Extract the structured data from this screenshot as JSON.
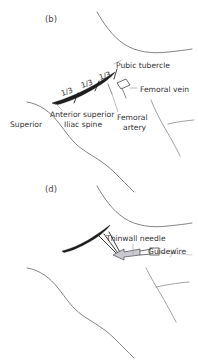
{
  "figure": {
    "background_color": "#ffffff",
    "ink_color": "#2e2e2e",
    "contour_color": "#6e6e74",
    "ligament_color": "#1d1d1d",
    "leader_color": "#9a9aa0"
  },
  "panels": [
    {
      "id": "panel-b",
      "tag": "(b)",
      "tag_x": 45,
      "tag_y": 22,
      "labels": [
        {
          "name": "pubic-tubercle",
          "text": "Pubic tubercle",
          "x": 116,
          "y": 68,
          "anchor": "start"
        },
        {
          "name": "femoral-vein",
          "text": "Femoral vein",
          "x": 140,
          "y": 92,
          "anchor": "start"
        },
        {
          "name": "anterior-superior",
          "text": "Anterior superior",
          "x": 50,
          "y": 117,
          "anchor": "start"
        },
        {
          "name": "iliac-spine",
          "text": "Iliac spine",
          "x": 64,
          "y": 127,
          "anchor": "start"
        },
        {
          "name": "superior",
          "text": "Superior",
          "x": 10,
          "y": 127,
          "anchor": "start"
        },
        {
          "name": "femoral",
          "text": "Femoral",
          "x": 117,
          "y": 120,
          "anchor": "start"
        },
        {
          "name": "artery",
          "text": "artery",
          "x": 123,
          "y": 130,
          "anchor": "start"
        }
      ],
      "fractions": [
        {
          "name": "fraction-lateral",
          "text": "1/3",
          "x": 62,
          "y": 96,
          "rotate": -18
        },
        {
          "name": "fraction-middle",
          "text": "1/3",
          "x": 82,
          "y": 88,
          "rotate": -18
        },
        {
          "name": "fraction-medial",
          "text": "1/3",
          "x": 100,
          "y": 80,
          "rotate": -18
        }
      ]
    },
    {
      "id": "panel-d",
      "tag": "(d)",
      "tag_x": 45,
      "tag_y": 192,
      "labels": [
        {
          "name": "thinwall-needle",
          "text": "Thinwall needle",
          "x": 106,
          "y": 241,
          "anchor": "start"
        },
        {
          "name": "guidewire",
          "text": "Guidewire",
          "x": 148,
          "y": 254,
          "anchor": "start"
        }
      ],
      "fractions": []
    }
  ],
  "legend": {
    "structures": [
      "Pubic tubercle",
      "Femoral vein",
      "Femoral artery",
      "Anterior superior Iliac spine",
      "Inguinal ligament thirds"
    ],
    "instruments": [
      "Thinwall needle",
      "Guidewire"
    ]
  }
}
